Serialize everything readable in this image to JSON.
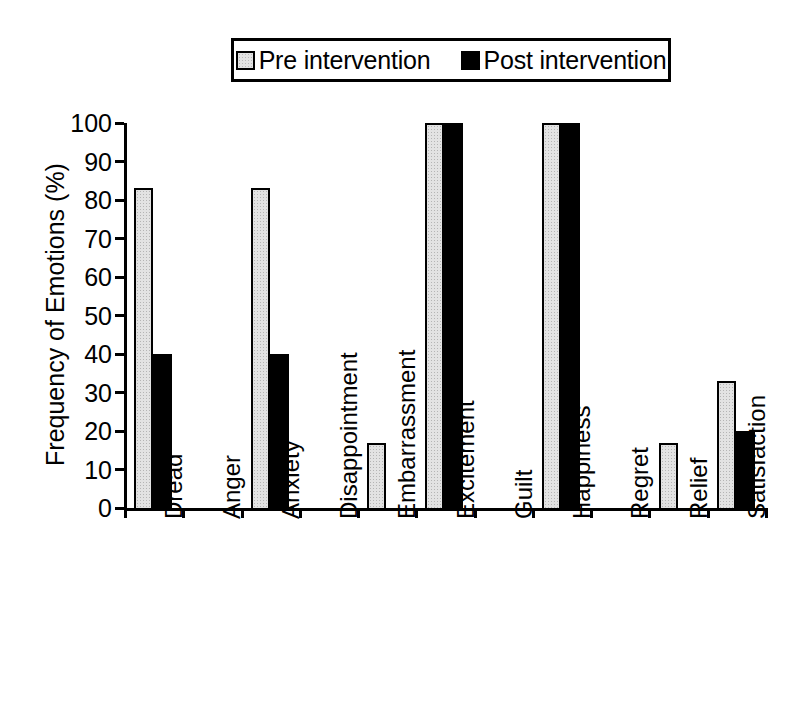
{
  "chart_data": {
    "type": "bar",
    "title": "",
    "xlabel": "",
    "ylabel": "Frequency of Emotions (%)",
    "ylim": [
      0,
      100
    ],
    "yticks": [
      0,
      10,
      20,
      30,
      40,
      50,
      60,
      70,
      80,
      90,
      100
    ],
    "grid": false,
    "legend_position": "top-center",
    "categories": [
      "Dread",
      "Anger",
      "Anxiety",
      "Disappointment",
      "Embarrassment",
      "Excitement",
      "Guilt",
      "Happiness",
      "Regret",
      "Relief",
      "Satisfaction"
    ],
    "series": [
      {
        "name": "Pre intervention",
        "color": "#e3e3e3",
        "values": [
          83,
          0,
          83,
          0,
          17,
          100,
          0,
          100,
          0,
          17,
          33
        ]
      },
      {
        "name": "Post intervention",
        "color": "#000000",
        "values": [
          40,
          0,
          40,
          0,
          0,
          100,
          0,
          100,
          0,
          0,
          20
        ]
      }
    ]
  },
  "legend": {
    "entries": [
      {
        "label": "Pre intervention",
        "swatch": "pre"
      },
      {
        "label": "Post intervention",
        "swatch": "post"
      }
    ]
  }
}
